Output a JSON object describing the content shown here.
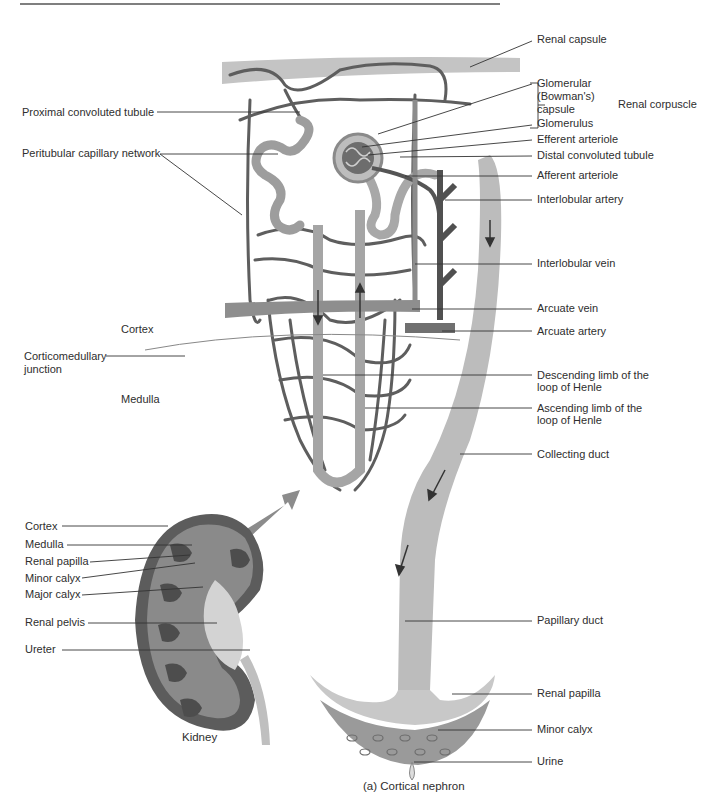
{
  "figure": {
    "caption": "(a) Cortical nephron",
    "kidney_caption": "Kidney",
    "bracket_label": "Renal corpuscle"
  },
  "labels_right": {
    "renal_capsule": "Renal capsule",
    "glomerular_capsule_1": "Glomerular",
    "glomerular_capsule_2": "(Bowman's)",
    "glomerular_capsule_3": "capsule",
    "glomerulus": "Glomerulus",
    "efferent_arteriole": "Efferent arteriole",
    "distal_convoluted_tubule": "Distal convoluted tubule",
    "afferent_arteriole": "Afferent arteriole",
    "interlobular_artery": "Interlobular artery",
    "interlobular_vein": "Interlobular vein",
    "arcuate_vein": "Arcuate vein",
    "arcuate_artery": "Arcuate artery",
    "descending_limb_1": "Descending limb of the",
    "descending_limb_2": "loop of Henle",
    "ascending_limb_1": "Ascending limb of the",
    "ascending_limb_2": "loop of Henle",
    "collecting_duct": "Collecting duct",
    "papillary_duct": "Papillary duct",
    "renal_papilla": "Renal papilla",
    "minor_calyx": "Minor calyx",
    "urine": "Urine"
  },
  "labels_left": {
    "proximal_convoluted_tubule": "Proximal convoluted tubule",
    "peritubular_capillary_network": "Peritubular capillary network",
    "cortex_region": "Cortex",
    "corticomedullary_1": "Corticomedullary",
    "corticomedullary_2": "junction",
    "medulla_region": "Medulla"
  },
  "labels_kidney": {
    "cortex": "Cortex",
    "medulla": "Medulla",
    "renal_papilla": "Renal papilla",
    "minor_calyx": "Minor calyx",
    "major_calyx": "Major calyx",
    "renal_pelvis": "Renal pelvis",
    "ureter": "Ureter"
  },
  "colors": {
    "vessel_dark": "#5a5a5a",
    "vessel_mid": "#8a8a8a",
    "tubule": "#a9a9a9",
    "duct": "#b8b8b8",
    "leader": "#333333"
  }
}
